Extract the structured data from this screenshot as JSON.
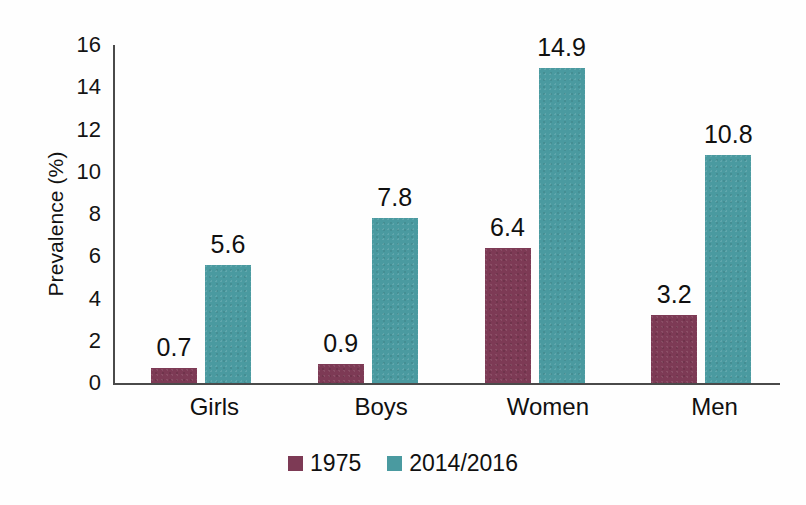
{
  "chart_data": {
    "type": "bar",
    "title": "",
    "xlabel": "",
    "ylabel": "Prevalence (%)",
    "categories": [
      "Girls",
      "Boys",
      "Women",
      "Men"
    ],
    "series": [
      {
        "name": "1975",
        "color": "#7d3a55",
        "values": [
          0.7,
          0.9,
          6.4,
          3.2
        ]
      },
      {
        "name": "2014/2016",
        "color": "#4a9aa0",
        "values": [
          5.6,
          7.8,
          14.9,
          10.8
        ]
      }
    ],
    "ylim": [
      0,
      16
    ],
    "yticks": [
      0,
      2,
      4,
      6,
      8,
      10,
      12,
      14,
      16
    ],
    "ytick_labels": [
      "0",
      "2",
      "4",
      "6",
      "8",
      "10",
      "12",
      "14",
      "16"
    ],
    "grid": false,
    "legend_position": "bottom",
    "data_labels": [
      [
        "0.7",
        "5.6"
      ],
      [
        "0.9",
        "7.8"
      ],
      [
        "6.4",
        "14.9"
      ],
      [
        "3.2",
        "10.8"
      ]
    ]
  },
  "axis": {
    "y_title": "Prevalence (%)"
  },
  "legend": {
    "items": [
      {
        "label": "1975"
      },
      {
        "label": "2014/2016"
      }
    ]
  }
}
